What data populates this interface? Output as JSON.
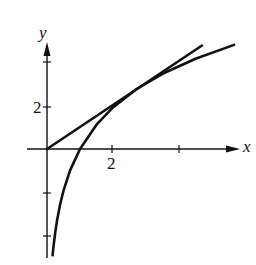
{
  "diagram": {
    "axes": {
      "x_label": "x",
      "y_label": "y",
      "x_tick_label": "2",
      "y_tick_label": "2"
    },
    "colors": {
      "ink": "#111111",
      "background": "#ffffff"
    },
    "curves": [
      {
        "name": "log-curve",
        "kind": "y = k ln x"
      },
      {
        "name": "tangent-line",
        "kind": "line through origin tangent to curve"
      }
    ]
  }
}
